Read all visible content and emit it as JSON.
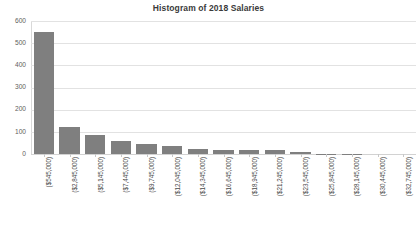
{
  "chart_data": {
    "type": "bar",
    "title": "Histogram of 2018 Salaries",
    "xlabel": "",
    "ylabel": "",
    "ylim": [
      0,
      600
    ],
    "ytick_labels": [
      "600",
      "500",
      "400",
      "300",
      "200",
      "100",
      "0"
    ],
    "ytick_values": [
      600,
      500,
      400,
      300,
      200,
      100,
      0
    ],
    "grid": true,
    "legend": false,
    "bar_color": "#7f7f7f",
    "categories": [
      "($545,000)",
      "($2,845,000)",
      "($5,145,000)",
      "($7,445,000)",
      "($9,745,000)",
      "($12,045,000)",
      "($14,345,000)",
      "($16,645,000)",
      "($18,945,000)",
      "($21,245,000)",
      "($23,545,000)",
      "($25,845,000)",
      "($28,145,000)",
      "($30,445,000)",
      "($32,745,000)"
    ],
    "values": [
      552,
      124,
      86,
      57,
      46,
      38,
      23,
      18,
      16,
      17,
      8,
      2,
      1,
      0,
      0
    ]
  },
  "chart": {
    "title": "Histogram of 2018 Salaries"
  }
}
